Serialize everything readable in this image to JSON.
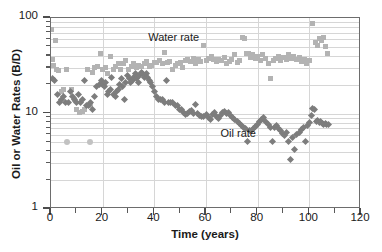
{
  "chart_data": {
    "type": "scatter",
    "title": "",
    "xlabel": "Time (years)",
    "ylabel": "Oil or Water Rates (B/D)",
    "xlim": [
      0,
      120
    ],
    "ylim": [
      1,
      100
    ],
    "yscale": "log",
    "xscale": "linear",
    "grid": true,
    "legend_position": "inline-annotation",
    "xticks": [
      0,
      20,
      40,
      60,
      80,
      100,
      120
    ],
    "xticklabels": [
      "0",
      "20",
      "40",
      "60",
      "80",
      "100",
      "120"
    ],
    "xminorticks": [
      10,
      30,
      50,
      70,
      90,
      110
    ],
    "yticks": [
      1,
      10,
      100
    ],
    "yticklabels": [
      "1",
      "10",
      "100"
    ],
    "yminorticks": [
      2,
      3,
      4,
      5,
      6,
      7,
      8,
      9,
      20,
      30,
      40,
      50,
      60,
      70,
      80,
      90
    ],
    "annotations": [
      {
        "text": "Water  rate",
        "x": 38,
        "y": 60
      },
      {
        "text": "Oil rate",
        "x": 66,
        "y": 5.9
      }
    ],
    "series": [
      {
        "name": "Water rate",
        "marker": "square",
        "color": "#b3b3b3",
        "points": [
          [
            0.3,
            75
          ],
          [
            0.6,
            37
          ],
          [
            1.0,
            32
          ],
          [
            1.6,
            58
          ],
          [
            2.2,
            29
          ],
          [
            3.0,
            28
          ],
          [
            4.2,
            17
          ],
          [
            5.0,
            18
          ],
          [
            6.0,
            29
          ],
          [
            8.0,
            18
          ],
          [
            9.2,
            14
          ],
          [
            10.0,
            11
          ],
          [
            11.0,
            10.3
          ],
          [
            12.0,
            10.6
          ],
          [
            12.8,
            10.9
          ],
          [
            14.0,
            29
          ],
          [
            15.2,
            12
          ],
          [
            16.0,
            27
          ],
          [
            17.0,
            30
          ],
          [
            18.0,
            31
          ],
          [
            19.2,
            42
          ],
          [
            20.0,
            29
          ],
          [
            21.0,
            30
          ],
          [
            22.0,
            26
          ],
          [
            23.0,
            40
          ],
          [
            24.0,
            29
          ],
          [
            25.0,
            31
          ],
          [
            26.0,
            33
          ],
          [
            27.0,
            29
          ],
          [
            28.0,
            33
          ],
          [
            29.0,
            36
          ],
          [
            30.0,
            29
          ],
          [
            31.0,
            31
          ],
          [
            32.0,
            33
          ],
          [
            33.0,
            30
          ],
          [
            34.0,
            32
          ],
          [
            35.0,
            31
          ],
          [
            36.0,
            33
          ],
          [
            37.0,
            35
          ],
          [
            38.0,
            31
          ],
          [
            39.0,
            32
          ],
          [
            40.0,
            34
          ],
          [
            41.0,
            34
          ],
          [
            42.0,
            36
          ],
          [
            43.0,
            33
          ],
          [
            44.0,
            44
          ],
          [
            45.0,
            34
          ],
          [
            46.0,
            35
          ],
          [
            47.0,
            29
          ],
          [
            48.0,
            32
          ],
          [
            49.0,
            33
          ],
          [
            50.0,
            34
          ],
          [
            51.0,
            30
          ],
          [
            52.0,
            36
          ],
          [
            53.0,
            37
          ],
          [
            54.0,
            35
          ],
          [
            55.0,
            38
          ],
          [
            56.0,
            33
          ],
          [
            57.0,
            37
          ],
          [
            58.0,
            35
          ],
          [
            59.0,
            51
          ],
          [
            60.0,
            36
          ],
          [
            61.0,
            38
          ],
          [
            62.0,
            40
          ],
          [
            63.0,
            37
          ],
          [
            64.0,
            35
          ],
          [
            65.0,
            37
          ],
          [
            66.0,
            36
          ],
          [
            67.0,
            39
          ],
          [
            68.0,
            33
          ],
          [
            69.0,
            35
          ],
          [
            70.0,
            37
          ],
          [
            71.0,
            41
          ],
          [
            72.0,
            34
          ],
          [
            73.0,
            36
          ],
          [
            74.0,
            63
          ],
          [
            74.8,
            61
          ],
          [
            75.6,
            42
          ],
          [
            76.4,
            43
          ],
          [
            77.2,
            39
          ],
          [
            78.0,
            41
          ],
          [
            79.0,
            38
          ],
          [
            80.0,
            40
          ],
          [
            81.0,
            36
          ],
          [
            82.0,
            41
          ],
          [
            83.0,
            38
          ],
          [
            84.0,
            33
          ],
          [
            85.0,
            23
          ],
          [
            86.0,
            36
          ],
          [
            87.0,
            38
          ],
          [
            88.0,
            40
          ],
          [
            89.0,
            36
          ],
          [
            90.0,
            39
          ],
          [
            91.0,
            37
          ],
          [
            92.0,
            41
          ],
          [
            93.0,
            38
          ],
          [
            94.0,
            40
          ],
          [
            95.0,
            37
          ],
          [
            96.0,
            39
          ],
          [
            97.0,
            35
          ],
          [
            98.0,
            37
          ],
          [
            99.0,
            33
          ],
          [
            100.0,
            36
          ],
          [
            101.2,
            88
          ],
          [
            102.2,
            55
          ],
          [
            103.0,
            52
          ],
          [
            103.8,
            61
          ],
          [
            104.6,
            58
          ],
          [
            105.4,
            62
          ],
          [
            106.2,
            50
          ],
          [
            107.0,
            42
          ]
        ]
      },
      {
        "name": "Oil rate",
        "marker": "diamond",
        "color": "#7d7d7d",
        "points": [
          [
            0.4,
            23
          ],
          [
            1.2,
            22
          ],
          [
            2.6,
            16
          ],
          [
            3.4,
            13
          ],
          [
            4.2,
            14
          ],
          [
            5.0,
            15
          ],
          [
            5.8,
            13
          ],
          [
            6.6,
            13
          ],
          [
            7.4,
            17
          ],
          [
            8.2,
            15
          ],
          [
            9.0,
            14
          ],
          [
            9.8,
            13
          ],
          [
            10.6,
            16
          ],
          [
            11.4,
            13
          ],
          [
            12.2,
            14
          ],
          [
            13.0,
            22
          ],
          [
            13.8,
            12
          ],
          [
            14.6,
            12
          ],
          [
            15.4,
            13
          ],
          [
            16.2,
            11
          ],
          [
            17.0,
            15
          ],
          [
            17.8,
            19
          ],
          [
            18.6,
            20
          ],
          [
            19.4,
            22
          ],
          [
            20.0,
            20
          ],
          [
            20.6,
            19
          ],
          [
            21.2,
            21
          ],
          [
            21.8,
            16
          ],
          [
            22.4,
            17
          ],
          [
            23.0,
            18
          ],
          [
            23.6,
            24
          ],
          [
            24.2,
            16
          ],
          [
            24.8,
            15
          ],
          [
            25.4,
            17
          ],
          [
            26.0,
            18
          ],
          [
            26.6,
            20
          ],
          [
            27.2,
            23
          ],
          [
            27.8,
            19
          ],
          [
            28.4,
            14
          ],
          [
            29.0,
            21
          ],
          [
            29.6,
            25
          ],
          [
            30.2,
            23
          ],
          [
            30.8,
            21
          ],
          [
            31.4,
            22
          ],
          [
            32.0,
            24
          ],
          [
            32.6,
            26
          ],
          [
            33.2,
            23
          ],
          [
            33.8,
            21
          ],
          [
            34.4,
            25
          ],
          [
            35.0,
            27
          ],
          [
            35.6,
            26
          ],
          [
            36.2,
            24
          ],
          [
            36.8,
            26
          ],
          [
            37.4,
            24
          ],
          [
            38.0,
            22
          ],
          [
            38.6,
            21
          ],
          [
            39.2,
            19
          ],
          [
            40.0,
            17
          ],
          [
            40.8,
            15
          ],
          [
            41.6,
            14
          ],
          [
            42.4,
            14
          ],
          [
            43.2,
            14
          ],
          [
            44.0,
            13
          ],
          [
            44.8,
            22
          ],
          [
            45.6,
            13
          ],
          [
            46.4,
            13
          ],
          [
            47.2,
            13
          ],
          [
            48.0,
            12
          ],
          [
            48.8,
            12
          ],
          [
            49.6,
            11
          ],
          [
            50.4,
            11
          ],
          [
            51.2,
            10.2
          ],
          [
            52.0,
            9.8
          ],
          [
            52.8,
            10.0
          ],
          [
            53.6,
            10.4
          ],
          [
            54.4,
            10.7
          ],
          [
            55.2,
            10.0
          ],
          [
            56.0,
            12.3
          ],
          [
            56.8,
            10.0
          ],
          [
            57.6,
            9.5
          ],
          [
            58.4,
            9.2
          ],
          [
            59.2,
            9.4
          ],
          [
            60.0,
            9.7
          ],
          [
            60.8,
            9.0
          ],
          [
            61.6,
            8.6
          ],
          [
            62.4,
            9.8
          ],
          [
            63.2,
            10.2
          ],
          [
            64.0,
            9.2
          ],
          [
            64.8,
            8.8
          ],
          [
            65.6,
            9.5
          ],
          [
            66.4,
            10.3
          ],
          [
            67.2,
            10.4
          ],
          [
            68.0,
            10.1
          ],
          [
            68.8,
            10.3
          ],
          [
            69.6,
            9.6
          ],
          [
            70.4,
            9.1
          ],
          [
            71.2,
            8.6
          ],
          [
            72.0,
            8.2
          ],
          [
            72.8,
            7.8
          ],
          [
            73.6,
            7.4
          ],
          [
            74.4,
            7.1
          ],
          [
            75.2,
            6.9
          ],
          [
            76.0,
            5.1
          ],
          [
            76.8,
            6.6
          ],
          [
            77.6,
            6.6
          ],
          [
            78.4,
            7.0
          ],
          [
            79.2,
            7.3
          ],
          [
            80.0,
            7.7
          ],
          [
            80.8,
            8.2
          ],
          [
            81.6,
            8.6
          ],
          [
            82.4,
            9.1
          ],
          [
            83.2,
            8.2
          ],
          [
            84.0,
            7.6
          ],
          [
            84.8,
            7.2
          ],
          [
            85.6,
            5.1
          ],
          [
            86.4,
            7.1
          ],
          [
            87.2,
            7.4
          ],
          [
            88.0,
            7.0
          ],
          [
            88.8,
            6.6
          ],
          [
            89.6,
            6.2
          ],
          [
            90.4,
            5.9
          ],
          [
            91.2,
            6.3
          ],
          [
            92.0,
            5.1
          ],
          [
            92.8,
            3.3
          ],
          [
            93.6,
            5.6
          ],
          [
            94.4,
            4.2
          ],
          [
            95.2,
            6.0
          ],
          [
            96.0,
            6.3
          ],
          [
            96.8,
            6.8
          ],
          [
            97.6,
            7.2
          ],
          [
            98.4,
            5.1
          ],
          [
            99.2,
            7.5
          ],
          [
            100.0,
            8.0
          ],
          [
            100.8,
            9.6
          ],
          [
            101.4,
            11.4
          ],
          [
            102.0,
            11.0
          ],
          [
            102.6,
            8.2
          ],
          [
            103.2,
            8.4
          ],
          [
            103.8,
            8.0
          ],
          [
            104.4,
            8.3
          ],
          [
            105.0,
            7.9
          ],
          [
            105.6,
            7.6
          ],
          [
            106.2,
            7.9
          ],
          [
            106.8,
            7.6
          ],
          [
            107.4,
            7.7
          ]
        ]
      },
      {
        "name": "Low outliers",
        "marker": "circle",
        "color": "#c2c2c2",
        "points": [
          [
            6.0,
            5.0
          ],
          [
            15.0,
            5.0
          ]
        ]
      }
    ]
  }
}
